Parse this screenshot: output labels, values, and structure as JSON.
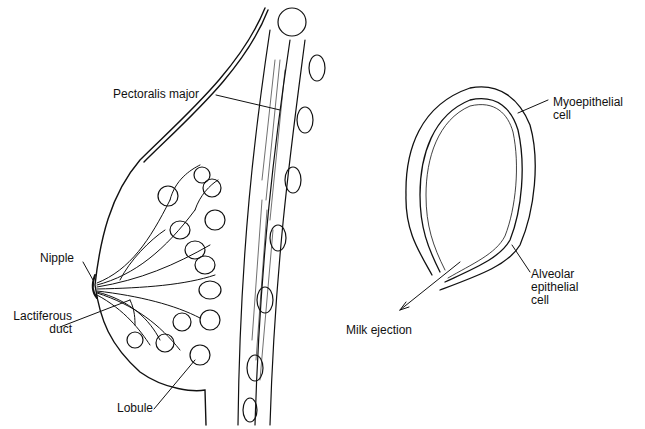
{
  "diagram": {
    "left_figure": {
      "name": "breast-cross-section",
      "labels": {
        "pectoralis": "Pectoralis major",
        "nipple": "Nipple",
        "lactiferous_line1": "Lactiferous",
        "lactiferous_line2": "duct",
        "lobule": "Lobule"
      }
    },
    "right_figure": {
      "name": "alveolus",
      "labels": {
        "myo_line1": "Myoepithelial",
        "myo_line2": "cell",
        "alv_line1": "Alveolar",
        "alv_line2": "epithelial",
        "alv_line3": "cell",
        "milk": "Milk ejection"
      }
    },
    "colors": {
      "ink": "#111111",
      "background": "#ffffff"
    }
  }
}
